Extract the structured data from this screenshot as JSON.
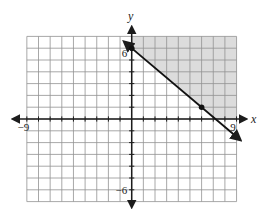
{
  "figure": {
    "width": 271,
    "height": 224,
    "background": "#ffffff"
  },
  "chart_data": {
    "type": "line",
    "subtype": "linear-inequality-coordinate-plane",
    "title": "",
    "axes": {
      "x_label": "x",
      "y_label": "y",
      "x_range": [
        -9,
        9
      ],
      "y_range": [
        -7,
        7
      ],
      "tick_step": 1,
      "grid": true,
      "labeled_ticks": {
        "x": [
          {
            "value": -9,
            "label": "−9"
          },
          {
            "value": 9,
            "label": "9"
          }
        ],
        "y": [
          {
            "value": 6,
            "label": "6"
          },
          {
            "value": -6,
            "label": "−6"
          }
        ]
      }
    },
    "boundary_line": {
      "slope": -0.8333,
      "slope_fraction": "-5/6",
      "y_intercept": 6,
      "x_intercept": 7.2,
      "style": "solid",
      "arrows_both_ends": true,
      "draw_x_extent": [
        -0.62,
        9.3
      ],
      "marked_points": [
        [
          0,
          6
        ],
        [
          6,
          1
        ]
      ]
    },
    "shaded_region": {
      "relation": "above-line",
      "polygon_units": [
        [
          0,
          6
        ],
        [
          0,
          7
        ],
        [
          9,
          7
        ],
        [
          9,
          0
        ],
        [
          7.2,
          0
        ]
      ]
    },
    "colors": {
      "shade": "#dcdcdc",
      "grid": "#929292",
      "axis": "#1c1c1c",
      "line": "#111111",
      "point": "#111111"
    }
  }
}
